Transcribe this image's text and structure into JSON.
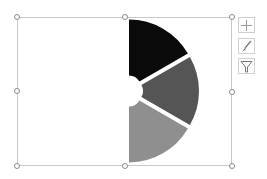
{
  "chart_data": {
    "type": "pie",
    "subtype": "exploded half-pie with hole",
    "title": "",
    "series": [
      {
        "name": "Slice 1",
        "value": 1,
        "color": "#0a0a0a"
      },
      {
        "name": "Slice 2",
        "value": 1,
        "color": "#555555"
      },
      {
        "name": "Slice 3",
        "value": 1,
        "color": "#8f8f8f"
      }
    ],
    "start_angle_deg": 0,
    "span_deg": 180,
    "legend": "none",
    "data_labels": "none"
  },
  "side_buttons": [
    {
      "name": "chart-elements",
      "icon": "plus-icon"
    },
    {
      "name": "chart-styles",
      "icon": "brush-icon"
    },
    {
      "name": "chart-filters",
      "icon": "filter-icon"
    }
  ]
}
